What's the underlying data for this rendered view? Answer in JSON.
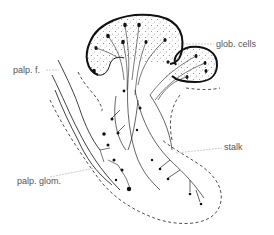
{
  "diagram": {
    "type": "anatomical line drawing",
    "colors": {
      "background": "#ffffff",
      "ink": "#111111",
      "label_text": "#555555",
      "leader_line": "#aaaaaa",
      "stipple": "#777777"
    },
    "labels": [
      {
        "id": "glob_cells",
        "text": "glob. cells"
      },
      {
        "id": "palp_f",
        "text": "palp. f."
      },
      {
        "id": "stalk",
        "text": "stalk"
      },
      {
        "id": "palp_glom",
        "text": "palp. glom."
      }
    ]
  }
}
